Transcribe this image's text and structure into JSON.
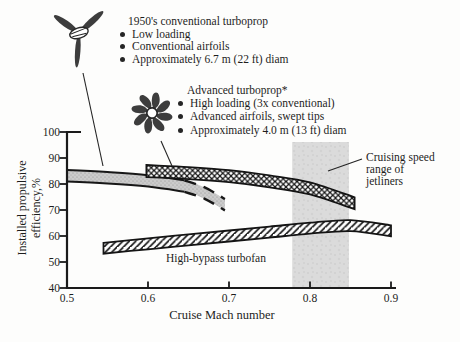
{
  "figure": {
    "conventional_block": {
      "title": "1950's conventional turboprop",
      "bullets": [
        "Low loading",
        "Conventional airfoils",
        "Approximately 6.7 m (22 ft) diam"
      ]
    },
    "advanced_block": {
      "title": "Advanced turboprop*",
      "bullets": [
        "High loading (3x conventional)",
        "Advanced airfoils, swept tips",
        "Approximately 4.0 m (13 ft) diam"
      ]
    },
    "cruising_annotation": {
      "lines": [
        "Cruising speed",
        "range of",
        "jetliners"
      ]
    }
  },
  "colors": {
    "ink": "#1d1d1d",
    "band_gray_fill": "#cbcbcb",
    "region_gray": "#dbdbdb",
    "background": "#fdfdfc"
  },
  "chart_data": {
    "type": "area",
    "title": "",
    "xlabel": "Cruise Mach number",
    "ylabel": "Installed propulsive efficiency,%",
    "ylabel_lines": [
      "Installed propulsive",
      "efficiency,%"
    ],
    "xlim": [
      0.5,
      0.9
    ],
    "ylim": [
      40,
      100
    ],
    "x_ticks": [
      0.5,
      0.6,
      0.7,
      0.8,
      0.9
    ],
    "y_ticks": [
      40,
      50,
      60,
      70,
      80,
      90,
      100
    ],
    "grid": false,
    "legend": "none (bands labeled by annotations)",
    "series": [
      {
        "name": "1950's conventional turboprop",
        "style": "gray-stipple-band, solid edges becoming dashed (extrapolated)",
        "band_halfwidth_pct": 2.2,
        "x": [
          0.5,
          0.55,
          0.6,
          0.645
        ],
        "y_center": [
          83.2,
          82.4,
          81.2,
          79.2
        ],
        "dashed_extension": {
          "x": [
            0.645,
            0.67,
            0.695
          ],
          "y_center": [
            79.2,
            76.5,
            72.0
          ]
        }
      },
      {
        "name": "Advanced turboprop",
        "style": "crosshatch-band",
        "band_halfwidth_pct": 2.3,
        "x": [
          0.598,
          0.65,
          0.7,
          0.75,
          0.8,
          0.855
        ],
        "y_center": [
          85.0,
          84.2,
          83.0,
          81.0,
          78.3,
          72.6
        ]
      },
      {
        "name": "High-bypass turbofan",
        "style": "diagonal-hatch-band",
        "band_halfwidth_pct": 2.1,
        "x": [
          0.545,
          0.6,
          0.65,
          0.7,
          0.75,
          0.8,
          0.85,
          0.9
        ],
        "y_center": [
          55.3,
          57.0,
          58.5,
          60.0,
          61.5,
          63.0,
          64.0,
          62.0
        ]
      }
    ],
    "highlight_region": {
      "label": "Cruising speed range of jetliners",
      "x_start": 0.778,
      "x_end": 0.848
    }
  }
}
